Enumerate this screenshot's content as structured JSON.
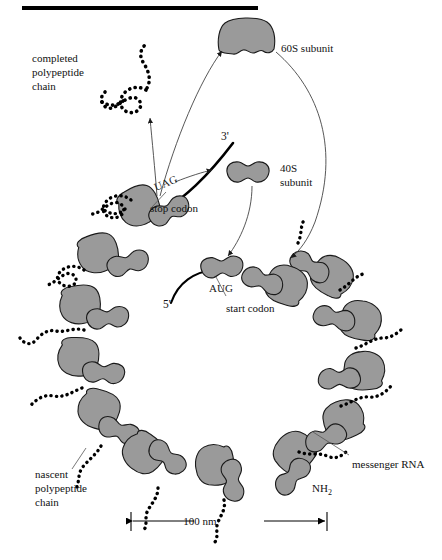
{
  "figure": {
    "title_bar": "",
    "labels": {
      "completed_chain": [
        "completed",
        "polypeptide",
        "chain"
      ],
      "nascent_chain": [
        "nascent",
        "polypeptide",
        "chain"
      ],
      "subunit_60s": "60S subunit",
      "subunit_40s": [
        "40S",
        "subunit"
      ],
      "stop_codon_seq": "UAG",
      "stop_codon_text": "stop codon",
      "start_codon_seq": "AUG",
      "start_codon_text": "start codon",
      "messenger_rna": "messenger RNA",
      "amino_terminus": "NH2",
      "amino_terminus_sub": "2",
      "end_3prime": "3'",
      "end_5prime": "5'",
      "scale_text": "100 nm"
    },
    "colors": {
      "ribosome_fill": "#9a9a9a",
      "ribosome_stroke": "#1a1a1a",
      "mrna_line": "#000000",
      "peptide_bead": "#000000",
      "leader_line": "#555555",
      "text": "#111111",
      "top_bar": "#000000",
      "background": "#ffffff"
    },
    "geometry": {
      "ring_center_x": 222,
      "ring_center_y": 330,
      "ring_radius": 133,
      "ribosome_count": 13,
      "scale_bar_x1": 131,
      "scale_bar_x2": 327,
      "scale_bar_y": 521,
      "top_bar_x1": 22,
      "top_bar_x2": 258,
      "top_bar_y": 8
    },
    "ribosomes": [
      {
        "id": "r-terminating",
        "angle": 118,
        "note": "at-stop-codon"
      },
      {
        "id": "r-2",
        "angle": 139
      },
      {
        "id": "r-3",
        "angle": 160
      },
      {
        "id": "r-4",
        "angle": 181
      },
      {
        "id": "r-5",
        "angle": 203
      },
      {
        "id": "r-6",
        "angle": 225
      },
      {
        "id": "r-7",
        "angle": 248
      },
      {
        "id": "r-8",
        "angle": 270
      },
      {
        "id": "r-9",
        "angle": 292
      },
      {
        "id": "r-10",
        "angle": 313
      },
      {
        "id": "r-11",
        "angle": 334
      },
      {
        "id": "r-12",
        "angle": 354
      },
      {
        "id": "r-13",
        "angle": 20
      },
      {
        "id": "r-initiating",
        "angle": 55,
        "note": "at-start-codon"
      }
    ],
    "free_subunits": [
      {
        "id": "free-60s",
        "x": 247,
        "y": 38,
        "type": "large"
      },
      {
        "id": "free-40s",
        "x": 248,
        "y": 172,
        "type": "small"
      }
    ]
  }
}
